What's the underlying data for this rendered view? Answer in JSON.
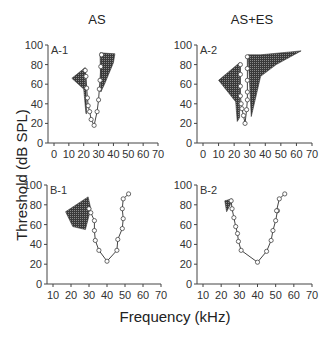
{
  "chart_data": [
    {
      "id": "A-1",
      "type": "line",
      "column_title": "AS",
      "xlabel": "Frequency (kHz)",
      "ylabel": "Threshold (dB SPL)",
      "xlim": [
        0,
        70
      ],
      "ylim": [
        0,
        100
      ],
      "xticks": [
        0,
        10,
        20,
        30,
        40,
        50,
        60,
        70
      ],
      "yticks": [
        0,
        20,
        40,
        60,
        80,
        100
      ],
      "series": [
        {
          "name": "tuning curve",
          "x": [
            21,
            21.5,
            22,
            22.5,
            23,
            24,
            25,
            27,
            29,
            30,
            30.5,
            31,
            31.5,
            32
          ],
          "y": [
            74,
            68,
            56,
            46,
            38,
            32,
            24,
            18,
            32,
            44,
            55,
            64,
            78,
            90
          ]
        }
      ],
      "shaded_regions": [
        {
          "name": "inhibitory-low",
          "x": [
            12,
            21,
            22,
            21.5,
            20
          ],
          "y": [
            66,
            77,
            30,
            30,
            55
          ]
        },
        {
          "name": "inhibitory-high",
          "x": [
            31,
            41,
            40,
            34,
            31.5
          ],
          "y": [
            92,
            91,
            82,
            60,
            52
          ]
        }
      ]
    },
    {
      "id": "A-2",
      "type": "line",
      "column_title": "AS+ES",
      "xlim": [
        0,
        70
      ],
      "ylim": [
        0,
        100
      ],
      "xticks": [
        0,
        10,
        20,
        30,
        40,
        50,
        60,
        70
      ],
      "yticks": [
        0,
        20,
        40,
        60,
        80,
        100
      ],
      "series": [
        {
          "name": "tuning curve",
          "x": [
            24,
            24,
            24,
            24,
            24.5,
            25,
            26,
            27,
            28,
            28.5,
            28.5,
            28.5,
            28.5,
            28.5
          ],
          "y": [
            80,
            70,
            58,
            48,
            40,
            35,
            28,
            20,
            34,
            44,
            52,
            64,
            76,
            88
          ]
        }
      ],
      "shaded_regions": [
        {
          "name": "inhibitory-low",
          "x": [
            10,
            23.5,
            23.5,
            22,
            21
          ],
          "y": [
            64,
            82,
            26,
            22,
            42
          ]
        },
        {
          "name": "inhibitory-high",
          "x": [
            29,
            37,
            63,
            47,
            37,
            31
          ],
          "y": [
            90,
            90,
            94,
            80,
            68,
            27
          ]
        }
      ]
    },
    {
      "id": "B-1",
      "type": "line",
      "xlim": [
        10,
        70
      ],
      "ylim": [
        0,
        100
      ],
      "xticks": [
        10,
        20,
        30,
        40,
        50,
        60,
        70
      ],
      "yticks": [
        0,
        20,
        40,
        60,
        80,
        100
      ],
      "series": [
        {
          "name": "tuning curve",
          "x": [
            30,
            31,
            33,
            33,
            33.5,
            35.5,
            40,
            45.5,
            46,
            48.5,
            49,
            48.5,
            49,
            52
          ],
          "y": [
            76,
            72,
            64,
            54,
            44,
            34,
            23,
            34,
            45,
            56,
            66,
            76,
            86,
            91
          ]
        }
      ],
      "shaded_regions": [
        {
          "name": "inhibitory-low",
          "x": [
            17,
            29.5,
            31,
            28,
            21
          ],
          "y": [
            73,
            88,
            76,
            55,
            58
          ]
        }
      ]
    },
    {
      "id": "B-2",
      "type": "line",
      "xlim": [
        10,
        70
      ],
      "ylim": [
        0,
        100
      ],
      "xticks": [
        10,
        20,
        30,
        40,
        50,
        60,
        70
      ],
      "yticks": [
        0,
        20,
        40,
        60,
        80,
        100
      ],
      "series": [
        {
          "name": "tuning curve",
          "x": [
            25.5,
            26,
            27,
            28,
            29,
            29.5,
            31,
            40,
            45,
            47.5,
            48.5,
            50,
            51,
            50.5,
            52,
            55
          ],
          "y": [
            84,
            76,
            67,
            58,
            51,
            43,
            34,
            22,
            33,
            44,
            54,
            64,
            74,
            74,
            86,
            91
          ]
        }
      ],
      "shaded_regions": [
        {
          "name": "inhibitory-low",
          "x": [
            22,
            26,
            25,
            23
          ],
          "y": [
            84,
            86,
            80,
            73
          ]
        }
      ]
    }
  ],
  "labels": {
    "col_left": "AS",
    "col_right": "AS+ES",
    "ylabel": "Threshold  (dB SPL)",
    "xlabel": "Frequency  (kHz)"
  }
}
